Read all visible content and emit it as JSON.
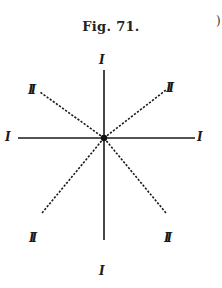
{
  "figure": {
    "caption": "Fig. 71.",
    "edge_mark": ")",
    "center": {
      "x": 104,
      "y": 138
    },
    "lines": {
      "solid": [
        {
          "name": "vertical-axis",
          "x1": 104,
          "y1": 70,
          "x2": 104,
          "y2": 240
        },
        {
          "name": "horizontal-axis",
          "x1": 18,
          "y1": 138,
          "x2": 195,
          "y2": 138
        }
      ],
      "dashed": [
        {
          "name": "diagonal-upper-left",
          "x1": 104,
          "y1": 138,
          "x2": 40,
          "y2": 92
        },
        {
          "name": "diagonal-upper-right",
          "x1": 104,
          "y1": 138,
          "x2": 166,
          "y2": 90
        },
        {
          "name": "diagonal-lower-left",
          "x1": 104,
          "y1": 138,
          "x2": 42,
          "y2": 213
        },
        {
          "name": "diagonal-lower-right",
          "x1": 104,
          "y1": 138,
          "x2": 166,
          "y2": 213
        }
      ]
    },
    "labels": {
      "top": "I",
      "bottom": "I",
      "left": "I",
      "right": "I",
      "upper_left": "II",
      "upper_right": "II",
      "lower_left": "II",
      "lower_right": "II"
    },
    "colors": {
      "ink": "#1a1a1a",
      "paper": "#ffffff"
    }
  }
}
